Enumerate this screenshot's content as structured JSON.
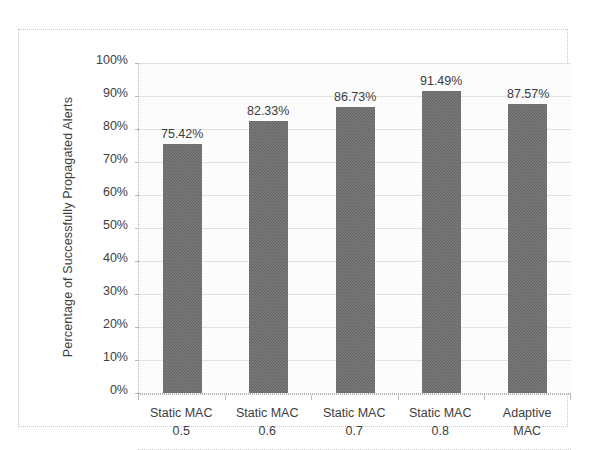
{
  "chart_data": {
    "type": "bar",
    "title": "",
    "subtitle": "",
    "xlabel": "",
    "ylabel": "Percentage of Successfully Propagated Alerts",
    "categories": [
      "Static MAC 0.5",
      "Static MAC 0.6",
      "Static MAC 0.7",
      "Static MAC 0.8",
      "Adaptive MAC"
    ],
    "category_lines": [
      [
        "Static MAC",
        "0.5"
      ],
      [
        "Static MAC",
        "0.6"
      ],
      [
        "Static MAC",
        "0.7"
      ],
      [
        "Static MAC",
        "0.8"
      ],
      [
        "Adaptive",
        "MAC"
      ]
    ],
    "values": [
      75.42,
      82.33,
      86.73,
      91.49,
      87.57
    ],
    "data_labels": [
      "75.42%",
      "82.33%",
      "86.73%",
      "91.49%",
      "87.57%"
    ],
    "ylim": [
      0,
      100
    ],
    "ytick_values": [
      0,
      10,
      20,
      30,
      40,
      50,
      60,
      70,
      80,
      90,
      100
    ],
    "ytick_labels": [
      "0%",
      "10%",
      "20%",
      "30%",
      "40%",
      "50%",
      "60%",
      "70%",
      "80%",
      "90%",
      "100%"
    ],
    "grid": true,
    "grid_axis": "y",
    "legend": false,
    "legend_position": "none",
    "series": [
      {
        "name": "Percentage of Successfully Propagated Alerts",
        "values": [
          75.42,
          82.33,
          86.73,
          91.49,
          87.57
        ],
        "color": "#7e7e7e"
      }
    ],
    "colors": {
      "bar_fill": "#7e7e7e",
      "bar_pattern": "#5f5f5f",
      "gridline": "#e2e2e2",
      "axis": "#b0b0b0",
      "text": "#3d3d3d",
      "plot_background": "#fcfcfc",
      "frame_border": "#c9c9c9"
    }
  }
}
